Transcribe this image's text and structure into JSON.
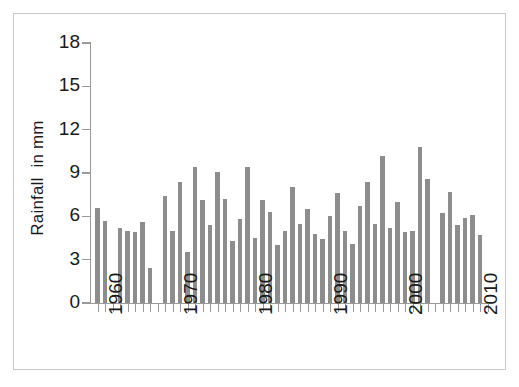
{
  "chart_data": {
    "type": "bar",
    "title": "",
    "subtitle": "",
    "xlabel": "",
    "ylabel": "Rainfall  in mm",
    "ylim": [
      0,
      18
    ],
    "y_ticks": [
      0,
      3,
      6,
      9,
      12,
      15,
      18
    ],
    "y_tick_labels": [
      "0",
      "3",
      "6",
      "9",
      "12",
      "15",
      "18"
    ],
    "xlim": [
      1959,
      2012
    ],
    "x_ticks": [
      1960,
      1970,
      1980,
      1990,
      2000,
      2010
    ],
    "x_tick_labels": [
      "1960",
      "1970",
      "1980",
      "1990",
      "2000",
      "2010"
    ],
    "grid": false,
    "legend": null,
    "bar_color": "#8d8d8d",
    "axis_color": "#9a9a9a",
    "text_color": "#1a1a1a",
    "frame_color": "#c8c8c8",
    "categories": [
      1960,
      1961,
      1963,
      1964,
      1965,
      1966,
      1967,
      1969,
      1970,
      1971,
      1972,
      1973,
      1974,
      1975,
      1976,
      1977,
      1978,
      1979,
      1980,
      1981,
      1982,
      1983,
      1984,
      1985,
      1986,
      1987,
      1988,
      1989,
      1990,
      1991,
      1992,
      1993,
      1994,
      1995,
      1996,
      1997,
      1998,
      1999,
      2000,
      2001,
      2002,
      2003,
      2004,
      2006,
      2007,
      2008,
      2009,
      2010,
      2011
    ],
    "values": [
      6.6,
      5.7,
      5.2,
      5.0,
      4.9,
      5.6,
      2.4,
      7.4,
      5.0,
      8.4,
      3.5,
      9.4,
      7.1,
      5.4,
      9.1,
      7.2,
      4.3,
      5.8,
      9.4,
      4.5,
      7.1,
      6.3,
      4.0,
      5.0,
      8.0,
      5.5,
      6.5,
      4.8,
      4.4,
      6.0,
      7.6,
      5.0,
      4.1,
      6.7,
      8.4,
      5.5,
      10.2,
      5.2,
      7.0,
      4.9,
      5.0,
      10.8,
      8.6,
      6.2,
      7.7,
      5.4,
      5.9,
      6.1,
      4.7
    ]
  }
}
